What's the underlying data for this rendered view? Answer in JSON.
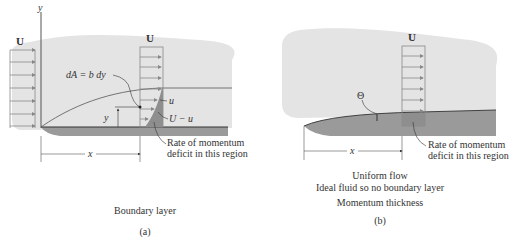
{
  "panel_a": {
    "y_axis_label": "y",
    "free_stream_left": "U",
    "free_stream_profile": "U",
    "area_element": "dA = b dy",
    "velocity_u": "u",
    "deficit_label": "U − u",
    "height_label": "y",
    "distance_label": "x",
    "callout_line1": "Rate of momentum",
    "callout_line2": "deficit in this region",
    "caption": "Boundary layer",
    "sublabel": "(a)"
  },
  "panel_b": {
    "free_stream_profile": "U",
    "theta_label": "Θ",
    "distance_label": "x",
    "callout_line1": "Rate of momentum",
    "callout_line2": "deficit in this region",
    "caption_line1": "Uniform flow",
    "caption_line2": "Ideal fluid so no boundary layer",
    "caption_line3": "Momentum thickness",
    "sublabel": "(b)"
  },
  "colors": {
    "fluid": "#e4e4e4",
    "plate": "#9a9a9a",
    "deficit_region": "#8e8e8e",
    "lines": "#555555"
  }
}
